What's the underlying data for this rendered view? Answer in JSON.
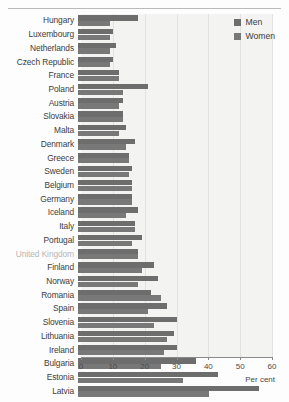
{
  "chart_data": {
    "type": "bar",
    "orientation": "horizontal",
    "title": "",
    "xlabel": "Per cent",
    "ylabel": "",
    "xlim": [
      0,
      60
    ],
    "xticks": [
      0,
      10,
      20,
      30,
      40,
      50,
      60
    ],
    "grid": true,
    "legend_position": "top-right",
    "categories": [
      "Hungary",
      "Luxembourg",
      "Netherlands",
      "Czech Republic",
      "France",
      "Poland",
      "Austria",
      "Slovakia",
      "Malta",
      "Denmark",
      "Greece",
      "Sweden",
      "Belgium",
      "Germany",
      "Iceland",
      "Italy",
      "Portugal",
      "United Kingdom",
      "Finland",
      "Norway",
      "Romania",
      "Spain",
      "Slovenia",
      "Lithuania",
      "Ireland",
      "Bulgaria",
      "Estonia",
      "Latvia"
    ],
    "series": [
      {
        "name": "Men",
        "color": "#6d6d6d",
        "values": [
          19,
          11,
          12,
          11,
          13,
          22,
          14,
          14,
          15,
          18,
          16,
          17,
          17,
          17,
          19,
          18,
          20,
          19,
          24,
          25,
          23,
          28,
          31,
          30,
          31,
          37,
          44,
          57
        ]
      },
      {
        "name": "Women",
        "color": "#787878",
        "values": [
          10,
          10,
          10,
          10,
          13,
          14,
          13,
          14,
          13,
          15,
          16,
          16,
          17,
          17,
          15,
          18,
          17,
          19,
          20,
          19,
          26,
          22,
          24,
          28,
          27,
          26,
          33,
          41
        ]
      }
    ]
  },
  "legend": {
    "items": [
      {
        "label": "Men"
      },
      {
        "label": "Women"
      }
    ]
  },
  "axis": {
    "title": "Per cent",
    "ticks": [
      "0",
      "10",
      "20",
      "30",
      "40",
      "50",
      "60"
    ]
  }
}
